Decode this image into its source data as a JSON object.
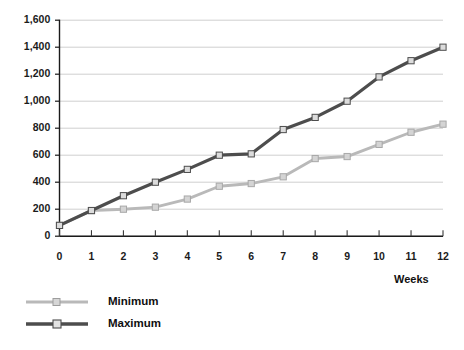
{
  "chart_data": {
    "type": "line",
    "title": "",
    "xlabel": "Weeks",
    "ylabel": "",
    "x": [
      0,
      1,
      2,
      3,
      4,
      5,
      6,
      7,
      8,
      9,
      10,
      11,
      12
    ],
    "categories": [
      "0",
      "1",
      "2",
      "3",
      "4",
      "5",
      "6",
      "7",
      "8",
      "9",
      "10",
      "11",
      "12"
    ],
    "series": [
      {
        "name": "Minimum",
        "color": "#b9b9b9",
        "marker": "square",
        "values": [
          80,
          190,
          200,
          215,
          275,
          370,
          390,
          440,
          575,
          590,
          680,
          770,
          830
        ]
      },
      {
        "name": "Maximum",
        "color": "#4d4d4d",
        "marker": "square",
        "values": [
          80,
          190,
          300,
          400,
          495,
          600,
          610,
          790,
          880,
          1000,
          1180,
          1300,
          1400
        ]
      }
    ],
    "ylim": [
      0,
      1600
    ],
    "yticks": [
      0,
      200,
      400,
      600,
      800,
      1000,
      1200,
      1400,
      1600
    ],
    "ytick_labels": [
      "0",
      "200",
      "400",
      "600",
      "800",
      "1,000",
      "1,200",
      "1,400",
      "1,600"
    ],
    "xlim": [
      0,
      12
    ],
    "grid": true,
    "grid_axis": "y",
    "grid_color": "#c9c9c9",
    "legend_position": "bottom-left",
    "legend": [
      "Minimum",
      "Maximum"
    ],
    "axis_color": "#1a1a1a",
    "background": "#ffffff"
  },
  "legend": {
    "minimum_label": "Minimum",
    "maximum_label": "Maximum"
  },
  "axes": {
    "x_title": "Weeks"
  }
}
